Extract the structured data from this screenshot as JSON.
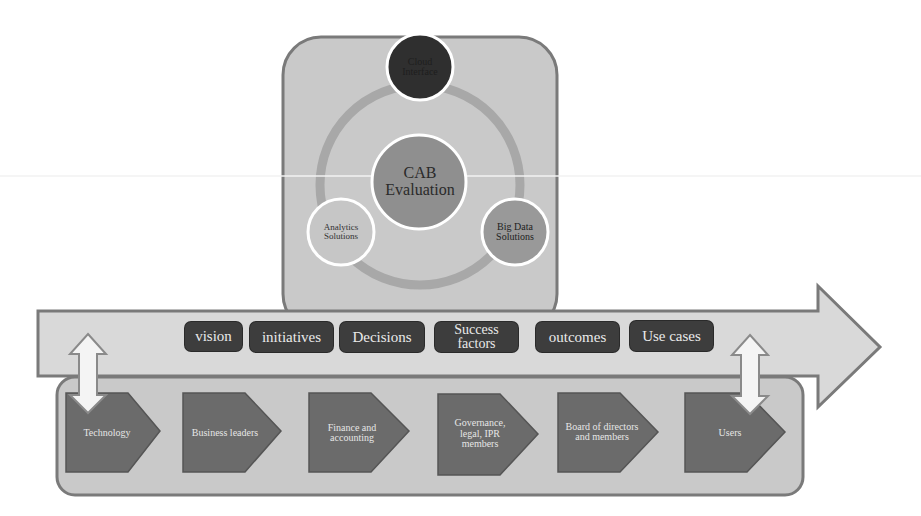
{
  "colors": {
    "panel_fill": "#c9c9c9",
    "panel_border": "#7a7a7a",
    "arrow_fill": "#d8d8d8",
    "pill_fill": "#3d3d3d",
    "chevron_fill": "#6b6b6b",
    "center_circle": "#8d8d8d",
    "top_circle": "#2f2f2f",
    "ring": "#a6a6a6"
  },
  "cycle": {
    "center": "CAB Evaluation",
    "top": "Cloud Interface",
    "left": "Analytics Solutions",
    "right": "Big Data Solutions"
  },
  "main_arrow": {
    "items": [
      "vision",
      "initiatives",
      "Decisions",
      "Success factors",
      "outcomes",
      "Use cases"
    ]
  },
  "stakeholders": {
    "items": [
      "Technology",
      "Business leaders",
      "Finance and accounting",
      "Governance, legal, IPR members",
      "Board of directors and members",
      "Users"
    ]
  },
  "connectors": {
    "left": "bidirectional-arrow",
    "right": "bidirectional-arrow"
  }
}
